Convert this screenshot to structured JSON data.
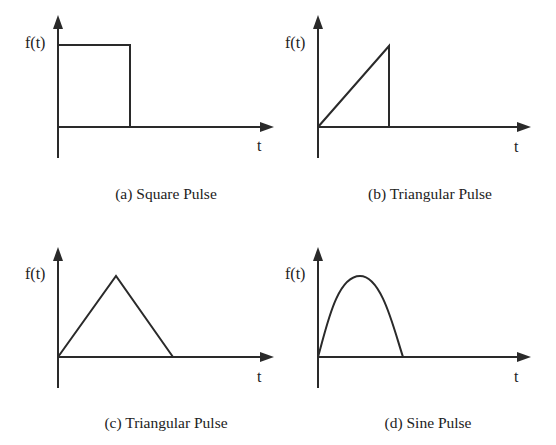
{
  "panels": [
    {
      "id": "a",
      "caption": "(a) Square Pulse",
      "y_label": "f(t)",
      "x_label": "t",
      "shape": "square"
    },
    {
      "id": "b",
      "caption": "(b) Triangular Pulse",
      "y_label": "f(t)",
      "x_label": "t",
      "shape": "ramp"
    },
    {
      "id": "c",
      "caption": "(c) Triangular Pulse",
      "y_label": "f(t)",
      "x_label": "t",
      "shape": "triangle"
    },
    {
      "id": "d",
      "caption": "(d) Sine Pulse",
      "y_label": "f(t)",
      "x_label": "t",
      "shape": "half-sine"
    }
  ],
  "colors": {
    "stroke": "#2a2a2a",
    "text": "#222222",
    "background": "#ffffff"
  }
}
